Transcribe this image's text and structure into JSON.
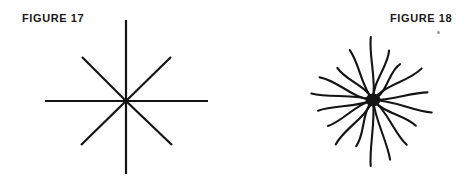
{
  "page": {
    "width": 469,
    "height": 186,
    "background": "#ffffff",
    "ink_color": "#141414"
  },
  "figures": [
    {
      "id": "figure-17",
      "label": "FIGURE 17",
      "label_position": {
        "x": 22,
        "y": 13
      },
      "kind": "regular-asterisk",
      "description": "Symmetric eight-spoke asterisk with straight ruled lines",
      "center": {
        "x": 126,
        "y": 101
      },
      "spoke_count": 8,
      "stroke_width": 2.2,
      "spokes": [
        {
          "name": "north",
          "angle_deg": 270,
          "length": 81,
          "end": {
            "x": 126,
            "y": 20
          }
        },
        {
          "name": "south",
          "angle_deg": 90,
          "length": 73,
          "end": {
            "x": 126,
            "y": 174
          }
        },
        {
          "name": "east",
          "angle_deg": 0,
          "length": 82,
          "end": {
            "x": 208,
            "y": 101
          }
        },
        {
          "name": "west",
          "angle_deg": 180,
          "length": 81,
          "end": {
            "x": 45,
            "y": 101
          }
        },
        {
          "name": "northeast",
          "angle_deg": 315,
          "length": 63,
          "end": {
            "x": 171,
            "y": 57
          }
        },
        {
          "name": "northwest",
          "angle_deg": 225,
          "length": 63,
          "end": {
            "x": 82,
            "y": 57
          }
        },
        {
          "name": "southeast",
          "angle_deg": 45,
          "length": 63,
          "end": {
            "x": 172,
            "y": 145
          }
        },
        {
          "name": "southwest",
          "angle_deg": 135,
          "length": 63,
          "end": {
            "x": 81,
            "y": 145
          }
        }
      ]
    },
    {
      "id": "figure-18",
      "label": "FIGURE 18",
      "label_position": {
        "x": 390,
        "y": 13
      },
      "kind": "irregular-starburst",
      "description": "Hand drawn starburst of wavy spokes of uneven length radiating from a solid dark blob",
      "center": {
        "x": 373,
        "y": 100
      },
      "hub": {
        "rx": 7.5,
        "ry": 6.5,
        "fill": "#141414"
      },
      "spoke_count": 18,
      "stroke_width": 2.1,
      "spokes": [
        {
          "name": "spoke-01",
          "angle_deg": 268,
          "length": 63,
          "curve": 5
        },
        {
          "name": "spoke-02",
          "angle_deg": 288,
          "length": 52,
          "curve": -7
        },
        {
          "name": "spoke-03",
          "angle_deg": 307,
          "length": 45,
          "curve": 9
        },
        {
          "name": "spoke-04",
          "angle_deg": 327,
          "length": 58,
          "curve": -8
        },
        {
          "name": "spoke-05",
          "angle_deg": 352,
          "length": 55,
          "curve": 4
        },
        {
          "name": "spoke-06",
          "angle_deg": 12,
          "length": 60,
          "curve": -5
        },
        {
          "name": "spoke-07",
          "angle_deg": 31,
          "length": 50,
          "curve": 7
        },
        {
          "name": "spoke-08",
          "angle_deg": 53,
          "length": 56,
          "curve": -6
        },
        {
          "name": "spoke-09",
          "angle_deg": 74,
          "length": 62,
          "curve": 4
        },
        {
          "name": "spoke-10",
          "angle_deg": 92,
          "length": 66,
          "curve": -4
        },
        {
          "name": "spoke-11",
          "angle_deg": 110,
          "length": 49,
          "curve": 8
        },
        {
          "name": "spoke-12",
          "angle_deg": 130,
          "length": 58,
          "curve": -7
        },
        {
          "name": "spoke-13",
          "angle_deg": 150,
          "length": 52,
          "curve": 6
        },
        {
          "name": "spoke-14",
          "angle_deg": 169,
          "length": 56,
          "curve": -5
        },
        {
          "name": "spoke-15",
          "angle_deg": 186,
          "length": 62,
          "curve": 5
        },
        {
          "name": "spoke-16",
          "angle_deg": 203,
          "length": 58,
          "curve": -8
        },
        {
          "name": "spoke-17",
          "angle_deg": 222,
          "length": 48,
          "curve": 7
        },
        {
          "name": "spoke-18",
          "angle_deg": 245,
          "length": 55,
          "curve": -6
        }
      ]
    }
  ],
  "artifacts": [
    {
      "name": "scan-speck",
      "shape": "dot",
      "color": "#9a9a9a",
      "position": {
        "x": 437,
        "y": 31
      },
      "size": 3
    }
  ]
}
